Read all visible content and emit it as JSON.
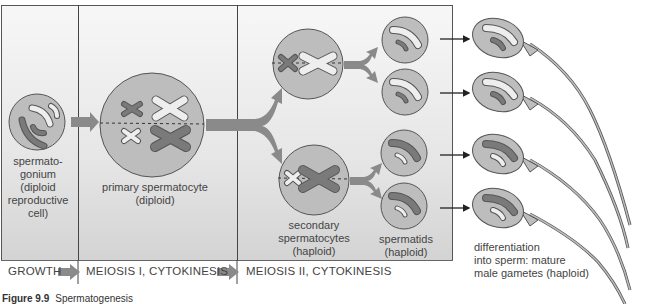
{
  "figure": {
    "caption_label": "Figure 9.9",
    "caption_text": "Spermatogenesis"
  },
  "stages": [
    {
      "label": "GROWTH"
    },
    {
      "label": "MEIOSIS I, CYTOKINESIS"
    },
    {
      "label": "MEIOSIS II, CYTOKINESIS"
    }
  ],
  "cells": {
    "spermatogonium": {
      "lines": [
        "spermato-",
        "gonium",
        "(diploid",
        "reproductive",
        "cell)"
      ]
    },
    "primary": {
      "lines": [
        "primary spermatocyte",
        "(diploid)"
      ]
    },
    "secondary": {
      "lines": [
        "secondary",
        "spermatocytes",
        "(haploid)"
      ]
    },
    "spermatids": {
      "lines": [
        "spermatids",
        "(haploid)"
      ]
    },
    "sperm": {
      "lines": [
        "differentiation",
        "into sperm: mature",
        "male gametes (haploid)"
      ]
    }
  },
  "colors": {
    "cell_fill": "#bdbdbd",
    "cell_stroke": "#555555",
    "dark_chromosome": "#7a7a7a",
    "light_chromosome": "#eeeeee",
    "arrow": "#8a8a8a"
  }
}
